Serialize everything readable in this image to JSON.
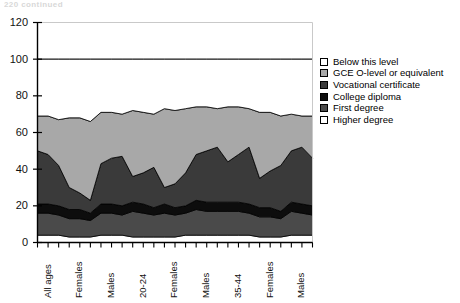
{
  "page": {
    "header_fragment": "220  continued"
  },
  "legend": {
    "position": "right",
    "items": [
      {
        "label": "Below this level",
        "color": "#ffffff",
        "name": "legend-below-this-level"
      },
      {
        "label": "GCE O-level or equivalent",
        "color": "#a8a8a8",
        "name": "legend-gce-o-level"
      },
      {
        "label": "Vocational certificate",
        "color": "#3a3a3a",
        "name": "legend-vocational-certificate"
      },
      {
        "label": "College diploma",
        "color": "#0d0d0d",
        "name": "legend-college-diploma"
      },
      {
        "label": "First degree",
        "color": "#4a4a4a",
        "name": "legend-first-degree"
      },
      {
        "label": "Higher degree",
        "color": "#ffffff",
        "name": "legend-higher-degree"
      }
    ]
  },
  "chart_data": {
    "type": "area",
    "stacked": true,
    "title": "",
    "subtitle": "",
    "xlabel": "",
    "ylabel": "",
    "ylim": [
      0,
      120
    ],
    "yticks": [
      0,
      20,
      40,
      60,
      80,
      100,
      120
    ],
    "ytick_labels": [
      "0",
      "20",
      "40",
      "60",
      "80",
      "100",
      "120"
    ],
    "grid": false,
    "legend_position": "right",
    "n_points": 27,
    "x_tick_count": 27,
    "x_label_every": 3,
    "x_tick_labels": [
      "All ages",
      "",
      "",
      "Females",
      "",
      "",
      "Males",
      "",
      "",
      "20-24",
      "",
      "",
      "Females",
      "",
      "",
      "Males",
      "",
      "",
      "35-44",
      "",
      "",
      "Females",
      "",
      "",
      "Males",
      "",
      ""
    ],
    "categories": [
      "All ages",
      "c2",
      "c3",
      "Females",
      "c5",
      "c6",
      "Males",
      "c8",
      "c9",
      "20-24",
      "c11",
      "c12",
      "Females",
      "c14",
      "c15",
      "Males",
      "c17",
      "c18",
      "35-44",
      "c20",
      "c21",
      "Females",
      "c23",
      "c24",
      "Males",
      "c26",
      "c27"
    ],
    "series": [
      {
        "name": "Higher degree",
        "color": "#ffffff",
        "values": [
          4,
          4,
          4,
          3,
          3,
          3,
          4,
          4,
          4,
          3,
          3,
          3,
          3,
          3,
          4,
          4,
          4,
          4,
          4,
          4,
          4,
          3,
          3,
          3,
          4,
          4,
          4
        ]
      },
      {
        "name": "First degree",
        "color": "#4a4a4a",
        "values": [
          12,
          12,
          11,
          10,
          10,
          9,
          12,
          12,
          11,
          14,
          13,
          12,
          13,
          12,
          12,
          14,
          13,
          13,
          13,
          13,
          12,
          11,
          11,
          10,
          13,
          12,
          11
        ]
      },
      {
        "name": "College diploma",
        "color": "#0d0d0d",
        "values": [
          5,
          5,
          5,
          5,
          5,
          4,
          5,
          5,
          5,
          5,
          5,
          4,
          5,
          4,
          4,
          5,
          5,
          5,
          5,
          5,
          5,
          5,
          5,
          4,
          5,
          5,
          5
        ]
      },
      {
        "name": "Vocational certificate",
        "color": "#3a3a3a",
        "values": [
          29,
          27,
          22,
          12,
          9,
          7,
          22,
          25,
          27,
          14,
          17,
          22,
          9,
          13,
          18,
          25,
          28,
          30,
          22,
          26,
          31,
          16,
          20,
          25,
          28,
          31,
          26
        ]
      },
      {
        "name": "GCE O-level or equivalent",
        "color": "#a8a8a8",
        "values": [
          19,
          21,
          25,
          38,
          41,
          43,
          28,
          25,
          23,
          36,
          33,
          29,
          43,
          40,
          35,
          26,
          24,
          21,
          30,
          26,
          21,
          36,
          32,
          27,
          20,
          17,
          23
        ]
      },
      {
        "name": "Below this level",
        "color": "#ffffff",
        "values": [
          31,
          31,
          33,
          32,
          32,
          34,
          29,
          29,
          30,
          28,
          29,
          30,
          27,
          28,
          27,
          26,
          26,
          27,
          26,
          26,
          27,
          29,
          29,
          31,
          30,
          31,
          31
        ]
      }
    ],
    "total_line": {
      "name": "Total (100%)",
      "values": [
        100,
        100,
        100,
        100,
        100,
        100,
        100,
        100,
        100,
        100,
        100,
        100,
        100,
        100,
        100,
        100,
        100,
        100,
        100,
        100,
        100,
        100,
        100,
        100,
        100,
        100,
        100
      ]
    }
  }
}
